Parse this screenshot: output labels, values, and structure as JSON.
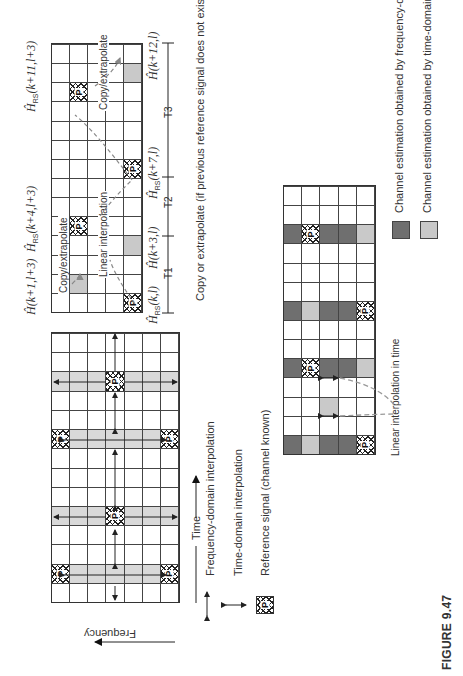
{
  "figure": {
    "caption": "FIGURE 9.47"
  },
  "main_grid": {
    "cols": 14,
    "rows": 7,
    "band_cols": [
      1,
      4,
      8,
      11
    ],
    "pilots": [
      {
        "col": 1,
        "row": 0
      },
      {
        "col": 1,
        "row": 6
      },
      {
        "col": 4,
        "row": 3
      },
      {
        "col": 8,
        "row": 0
      },
      {
        "col": 8,
        "row": 6
      },
      {
        "col": 11,
        "row": 3
      }
    ],
    "pilot_label": "P",
    "axis_time": "Time",
    "axis_frequency": "Frequency"
  },
  "legend_top": {
    "freq_interp": "Frequency-domain interpolation",
    "time_interp": "Time-domain interpolation",
    "reference": "Reference signal (channel known)"
  },
  "top_grid": {
    "cols": 14,
    "rows": 5,
    "pilots": [
      {
        "col": 0,
        "row": 4
      },
      {
        "col": 4,
        "row": 1
      },
      {
        "col": 7,
        "row": 4
      },
      {
        "col": 11,
        "row": 1
      }
    ],
    "light_cells": [
      {
        "col": 1,
        "row": 1
      },
      {
        "col": 3,
        "row": 4
      },
      {
        "col": 12,
        "row": 4
      }
    ],
    "labels_top": {
      "h1": "Ĥ(k+1,l+3)",
      "h2_main": "Ĥ",
      "h2_sub": "RS",
      "h2_rest": "(k+4,l+3)",
      "h3_main": "Ĥ",
      "h3_sub": "RS",
      "h3_rest": "(k+11,l+3)"
    },
    "labels_bottom": {
      "b1_main": "Ĥ",
      "b1_sub": "RS",
      "b1_rest": "(k,l)",
      "b2": "Ĥ(k+3,l)",
      "b3_main": "Ĥ",
      "b3_sub": "RS",
      "b3_rest": "(k+7,l)",
      "b4": "Ĥ(k+12,l)"
    },
    "annotations": {
      "copy1": "Copy/extrapolate",
      "linear": "Linear interpolation",
      "copy2": "Copy/extrapolate"
    },
    "intervals": [
      "T1",
      "T2",
      "T3"
    ],
    "note": "Copy or extrapolate (if previous reference signal does not exist)"
  },
  "result_grid": {
    "cols": 14,
    "rows": 5,
    "columns": {
      "0": [
        "dark",
        "light",
        "dark",
        "dark",
        "pilot"
      ],
      "2": [
        "",
        "",
        "light",
        "",
        ""
      ],
      "4": [
        "dark",
        "pilot",
        "dark",
        "dark",
        "light"
      ],
      "7": [
        "dark",
        "light",
        "dark",
        "dark",
        "pilot"
      ],
      "11": [
        "dark",
        "pilot",
        "dark",
        "dark",
        "light"
      ]
    },
    "annotation": "Linear interpolation in time"
  },
  "legend_bottom": {
    "dark_label": "Channel estimation obtained by frequency-domain interpolation",
    "light_label": "Channel estimation obtained by time-domain interpolation",
    "dark_color": "#6f6f6f",
    "light_color": "#c9c9c9"
  }
}
